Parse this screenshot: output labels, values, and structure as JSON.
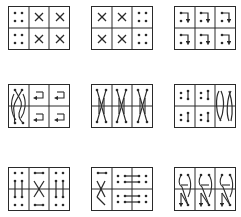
{
  "figure": {
    "colors": {
      "ink": "#2a2a2a",
      "background": "#ffffff"
    },
    "rows": [
      {
        "panels": [
          {
            "id": "p1",
            "pattern": "dots-cross-cross",
            "cells": [
              "dots",
              "X",
              "X",
              "dots",
              "X",
              "X"
            ]
          },
          {
            "id": "p2",
            "pattern": "cross-cross-dots",
            "cells": [
              "X",
              "X",
              "dots",
              "X",
              "X",
              "dots"
            ]
          },
          {
            "id": "p3",
            "pattern": "hook-arrows-down",
            "cells": [
              "hook",
              "hook",
              "hook",
              "hook",
              "hook",
              "hook"
            ]
          }
        ]
      },
      {
        "panels": [
          {
            "id": "p4",
            "pattern": "braid-left-arrows",
            "cells": [
              "braid",
              "left-arrow",
              "left-arrow",
              "braid",
              "left-arrow",
              "left-arrow"
            ]
          },
          {
            "id": "p5",
            "pattern": "long-cross-three",
            "cells": [
              "long-X",
              "long-X",
              "long-X",
              "long-X",
              "long-X",
              "long-X"
            ]
          },
          {
            "id": "p6",
            "pattern": "vertical-bars-arcs",
            "cells": [
              "bar",
              "bar",
              "arcs",
              "bar",
              "bar",
              "arcs"
            ]
          }
        ]
      },
      {
        "panels": [
          {
            "id": "p7",
            "pattern": "verticals-center-cross",
            "cells": [
              "dots-v",
              "hbar-X",
              "dots-v",
              "dots-v",
              "X-hbar",
              "dots-v"
            ]
          },
          {
            "id": "p8",
            "pattern": "cross-horizontal-lines",
            "cells": [
              "hbar-X",
              "dots-hbar",
              "dots-hbar",
              "X",
              "dots-hbar",
              "dots-hbar"
            ]
          },
          {
            "id": "p9",
            "pattern": "N-arrows",
            "cells": [
              "N",
              "N",
              "N",
              "N",
              "N",
              "N"
            ]
          }
        ]
      }
    ]
  }
}
